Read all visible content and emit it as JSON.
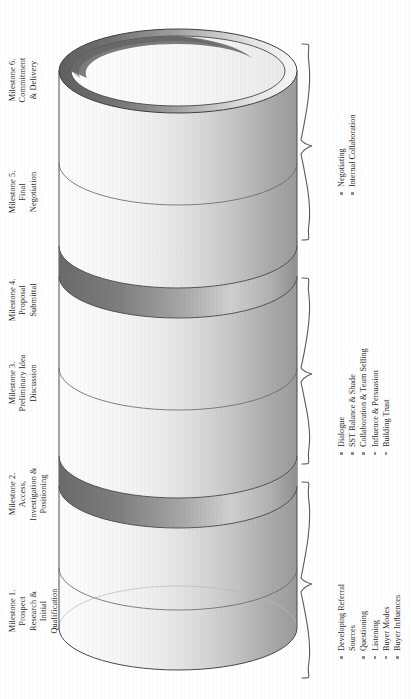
{
  "diagram": {
    "orientation": "rotated-90-ccw",
    "shape": "stacked-cylinder"
  },
  "milestones": [
    {
      "id": "m1",
      "lines": [
        "Milestone 1.",
        "Prospect",
        "Research &",
        "Initial",
        "Qualification"
      ]
    },
    {
      "id": "m2",
      "lines": [
        "Milestone 2.",
        "Access,",
        "Investigation &",
        "Positioning"
      ]
    },
    {
      "id": "m3",
      "lines": [
        "Milestone 3.",
        "Preliminary Idea",
        "Discussion"
      ]
    },
    {
      "id": "m4",
      "lines": [
        "Milestone 4.",
        "Proposal",
        "Submittal"
      ]
    },
    {
      "id": "m5",
      "lines": [
        "Milestone 5.",
        "Final",
        "Negotiation"
      ]
    },
    {
      "id": "m6",
      "lines": [
        "Milestone 6.",
        "Commitment",
        "& Delivery"
      ]
    }
  ],
  "skill_groups": [
    {
      "id": "group-1",
      "items": [
        {
          "lines": [
            "Developing Referral",
            "Sources"
          ]
        },
        {
          "lines": [
            "Questioning"
          ]
        },
        {
          "lines": [
            "Listening"
          ]
        },
        {
          "lines": [
            "Buyer Modes"
          ]
        },
        {
          "lines": [
            "Buyer Influences"
          ]
        }
      ]
    },
    {
      "id": "group-2",
      "items": [
        {
          "lines": [
            "Dialogue"
          ]
        },
        {
          "lines": [
            "SST Balance & Shade"
          ]
        },
        {
          "lines": [
            "Collaboration & Team Selling"
          ]
        },
        {
          "lines": [
            "Influence & Persuasion"
          ]
        },
        {
          "lines": [
            "Building Trust"
          ]
        }
      ]
    },
    {
      "id": "group-3",
      "items": [
        {
          "lines": [
            "Negotiating"
          ]
        },
        {
          "lines": [
            "Internal Collaboration"
          ]
        }
      ]
    }
  ],
  "colors": {
    "outline": "#3a3a3a",
    "body_light": "#fdfdfd",
    "body_mid": "#e6e6e6",
    "body_dark": "#9e9e9e",
    "cap_dark": "#6e6e6e",
    "band_dark": "#7a7a7a",
    "text": "#2c2c2c",
    "bullet": "#8d8d8d"
  }
}
